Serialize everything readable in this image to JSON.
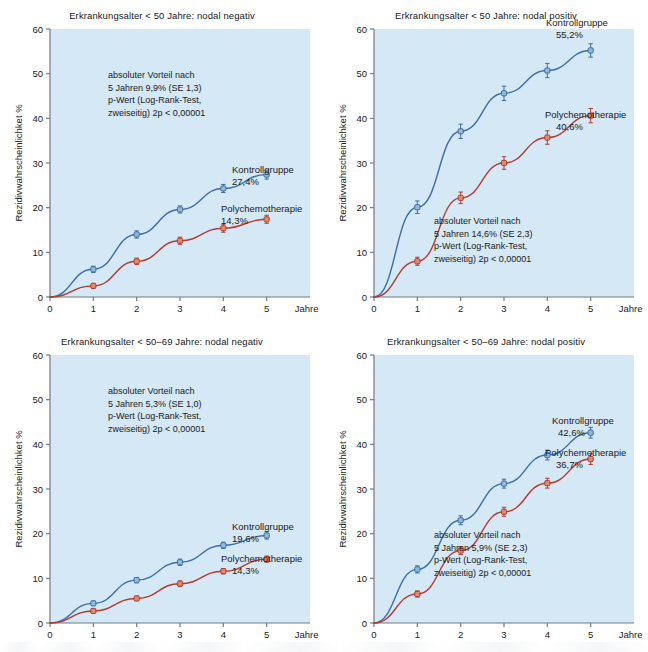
{
  "figure": {
    "width": 648,
    "height": 652,
    "background": "#ffffff",
    "plot_background": "#d4e8f5",
    "axis_color": "#6f7b85",
    "control_color": "#3b6ea5",
    "chemo_color": "#b5392f",
    "control_marker_fill": "#8fb8dc",
    "chemo_marker_fill": "#e08a6d"
  },
  "common": {
    "ylabel": "Rezidivwahrscheinlichket %",
    "xlabel": "Jahre",
    "yticks": [
      0,
      10,
      20,
      30,
      40,
      50,
      60
    ],
    "xticks": [
      0,
      1,
      2,
      3,
      4,
      5
    ],
    "ytick_labels": [
      "0",
      "10",
      "20",
      "30",
      "40",
      "50",
      "60"
    ],
    "xtick_labels": [
      "0",
      "1",
      "2",
      "3",
      "4",
      "5"
    ],
    "series_names": [
      "Kontrollgruppe",
      "Polychemotherapie"
    ]
  },
  "chart_data": [
    {
      "id": "panel-top-left",
      "type": "line",
      "title": "Erkrankungsalter < 50 Jahre: nodal negativ",
      "xlabel": "Jahre",
      "ylabel": "Rezidivwahrscheinlichket %",
      "xlim": [
        0,
        6
      ],
      "ylim": [
        0,
        60
      ],
      "grid": false,
      "legend_position": "inline-right",
      "x": [
        0,
        1,
        2,
        3,
        4,
        5
      ],
      "series": [
        {
          "name": "Kontrollgruppe",
          "color": "#3b6ea5",
          "values": [
            0,
            6.2,
            14.0,
            19.6,
            24.3,
            27.4
          ],
          "errors": [
            0,
            0.7,
            0.8,
            0.8,
            0.9,
            1.0
          ],
          "end_label": "Kontrollgruppe",
          "end_value": "27,4%"
        },
        {
          "name": "Polychemotherapie",
          "color": "#b5392f",
          "values": [
            0,
            2.5,
            8.0,
            12.6,
            15.4,
            17.4
          ],
          "errors": [
            0,
            0.5,
            0.7,
            0.8,
            0.9,
            0.9
          ],
          "end_label": "Polychemotherapie",
          "end_value": "14,3%"
        }
      ],
      "annotation": [
        "absoluter Vorteil nach",
        "5 Jahren 9,9% (SE 1,3)",
        "p-Wert (Log-Rank-Test,",
        "zweiseitig) 2p < 0,00001"
      ]
    },
    {
      "id": "panel-top-right",
      "type": "line",
      "title": "Erkrankungsalter < 50 Jahre: nodal positiv",
      "xlabel": "Jahre",
      "ylabel": "Rezidivwahrscheinlichket %",
      "xlim": [
        0,
        6
      ],
      "ylim": [
        0,
        60
      ],
      "grid": false,
      "legend_position": "inline-right",
      "x": [
        0,
        1,
        2,
        3,
        4,
        5
      ],
      "series": [
        {
          "name": "Kontrollgruppe",
          "color": "#3b6ea5",
          "values": [
            0,
            20.1,
            37.1,
            45.6,
            50.7,
            55.2
          ],
          "errors": [
            0,
            1.4,
            1.6,
            1.6,
            1.6,
            1.5
          ],
          "end_label": "Kontrollgruppe",
          "end_value": "55,2%"
        },
        {
          "name": "Polychemotherapie",
          "color": "#b5392f",
          "values": [
            0,
            8.0,
            22.2,
            30.0,
            35.7,
            40.6
          ],
          "errors": [
            0,
            0.9,
            1.3,
            1.4,
            1.5,
            1.6
          ],
          "end_label": "Polychemotherapie",
          "end_value": "40,6%"
        }
      ],
      "annotation": [
        "absoluter Vorteil nach",
        "5 Jahren 14,6% (SE 2,3)",
        "p-Wert (Log-Rank-Test,",
        "zweiseitig) 2p < 0,00001"
      ]
    },
    {
      "id": "panel-bottom-left",
      "type": "line",
      "title": "Erkrankungsalter <  50–69 Jahre: nodal negativ",
      "xlabel": "Jahre",
      "ylabel": "Rezidivwahrscheinlichket %",
      "xlim": [
        0,
        6
      ],
      "ylim": [
        0,
        60
      ],
      "grid": false,
      "legend_position": "inline-right",
      "x": [
        0,
        1,
        2,
        3,
        4,
        5
      ],
      "series": [
        {
          "name": "Kontrollgruppe",
          "color": "#3b6ea5",
          "values": [
            0,
            4.4,
            9.6,
            13.6,
            17.4,
            19.6
          ],
          "errors": [
            0,
            0.5,
            0.6,
            0.7,
            0.7,
            0.8
          ],
          "end_label": "Kontrollgruppe",
          "end_value": "19,6%"
        },
        {
          "name": "Polychemotherapie",
          "color": "#b5392f",
          "values": [
            0,
            2.7,
            5.5,
            8.8,
            11.6,
            14.3
          ],
          "errors": [
            0,
            0.4,
            0.5,
            0.6,
            0.6,
            0.7
          ],
          "end_label": "Polychemotherapie",
          "end_value": "14,3%"
        }
      ],
      "annotation": [
        "absoluter Vorteil nach",
        "5 Jahren  5,3% (SE 1,0)",
        "p-Wert (Log-Rank-Test,",
        "zweiseitig) 2p < 0,00001"
      ]
    },
    {
      "id": "panel-bottom-right",
      "type": "line",
      "title": "Erkrankungsalter <  50–69 Jahre: nodal positiv",
      "xlabel": "Jahre",
      "ylabel": "Rezidivwahrscheinlichket %",
      "xlim": [
        0,
        6
      ],
      "ylim": [
        0,
        60
      ],
      "grid": false,
      "legend_position": "inline-right",
      "x": [
        0,
        1,
        2,
        3,
        4,
        5
      ],
      "series": [
        {
          "name": "Kontrollgruppe",
          "color": "#3b6ea5",
          "values": [
            0,
            12.0,
            23.0,
            31.2,
            37.6,
            42.6
          ],
          "errors": [
            0,
            0.8,
            1.0,
            1.0,
            1.1,
            1.2
          ],
          "end_label": "Kontrollgruppe",
          "end_value": "42,6%"
        },
        {
          "name": "Polychemotherapie",
          "color": "#b5392f",
          "values": [
            0,
            6.5,
            16.2,
            24.9,
            31.3,
            36.7
          ],
          "errors": [
            0,
            0.7,
            0.9,
            1.0,
            1.1,
            1.2
          ],
          "end_label": "Polychemotherapie",
          "end_value": "36,7%"
        }
      ],
      "annotation": [
        "absoluter Vorteil nach",
        "5 Jahren 5,9% (SE 2,3)",
        "p-Wert (Log-Rank-Test,",
        "zweiseitig) 2p < 0,00001"
      ]
    }
  ],
  "annotation_positions": [
    {
      "x": 108,
      "y": 78
    },
    {
      "x": 110,
      "y": 224
    },
    {
      "x": 108,
      "y": 68
    },
    {
      "x": 110,
      "y": 212
    }
  ],
  "end_label_positions": [
    {
      "label_x": 232,
      "label_y": 173,
      "value_x": 232,
      "value_y": 185,
      "label2_x": 221,
      "label2_y": 212,
      "value2_x": 221,
      "value2_y": 224
    },
    {
      "label_x": 222,
      "label_y": 26,
      "value_x": 232,
      "value_y": 38,
      "label2_x": 221,
      "label2_y": 118,
      "value2_x": 232,
      "value2_y": 130
    },
    {
      "label_x": 232,
      "label_y": 204,
      "value_x": 232,
      "value_y": 216,
      "label2_x": 221,
      "label2_y": 236,
      "value2_x": 232,
      "value2_y": 248
    },
    {
      "label_x": 228,
      "label_y": 98,
      "value_x": 234,
      "value_y": 110,
      "label2_x": 221,
      "label2_y": 130,
      "value2_x": 232,
      "value2_y": 142
    }
  ]
}
